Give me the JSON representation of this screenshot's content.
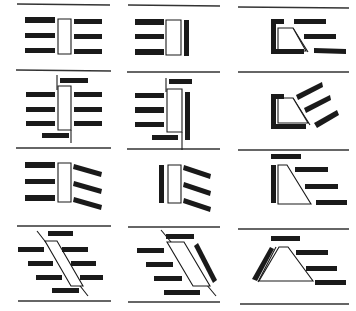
{
  "diagram": {
    "grid": {
      "rows": 4,
      "cols": 3
    },
    "colors": {
      "ink": "#1a1a1a",
      "paper": "#ffffff",
      "line": "#333333"
    },
    "separators": [
      {
        "x1": 17,
        "y1": 4,
        "x2": 110,
        "y2": 5
      },
      {
        "x1": 128,
        "y1": 5,
        "x2": 220,
        "y2": 6
      },
      {
        "x1": 238,
        "y1": 7,
        "x2": 349,
        "y2": 8
      },
      {
        "x1": 16,
        "y1": 70,
        "x2": 111,
        "y2": 71
      },
      {
        "x1": 127,
        "y1": 72,
        "x2": 220,
        "y2": 72
      },
      {
        "x1": 238,
        "y1": 72,
        "x2": 349,
        "y2": 72
      },
      {
        "x1": 16,
        "y1": 148,
        "x2": 111,
        "y2": 148
      },
      {
        "x1": 127,
        "y1": 149,
        "x2": 220,
        "y2": 149
      },
      {
        "x1": 238,
        "y1": 150,
        "x2": 349,
        "y2": 150
      },
      {
        "x1": 17,
        "y1": 226,
        "x2": 111,
        "y2": 226
      },
      {
        "x1": 128,
        "y1": 227,
        "x2": 220,
        "y2": 227
      },
      {
        "x1": 238,
        "y1": 229,
        "x2": 349,
        "y2": 229
      },
      {
        "x1": 18,
        "y1": 301,
        "x2": 111,
        "y2": 301
      },
      {
        "x1": 128,
        "y1": 302,
        "x2": 220,
        "y2": 302
      },
      {
        "x1": 240,
        "y1": 304,
        "x2": 349,
        "y2": 304
      }
    ],
    "panels": [
      {
        "id": "r1c1",
        "label": "Centre pier, perpendicular berths both sides",
        "outlines": [
          {
            "points": "58,19 71,19 71,54 58,54"
          }
        ],
        "bars": [
          "25,17 55,17 55,23 25,23",
          "25,33 55,33 55,38 25,38",
          "25,48 55,48 55,53 25,53",
          "74,19 102,19 102,24 74,24",
          "74,34 102,34 102,39 74,39",
          "74,49 102,49 102,54 74,54"
        ],
        "lines": []
      },
      {
        "id": "r1c2",
        "label": "Quay pier, perpendicular berths one side, wall backing",
        "outlines": [
          {
            "points": "166,20 181,20 181,55 166,55"
          }
        ],
        "bars": [
          "135,19 164,19 164,25 135,25",
          "135,34 164,34 164,39 135,39",
          "135,49 164,49 164,55 135,55",
          "184,20 189,20 189,56 184,56"
        ],
        "lines": []
      },
      {
        "id": "r1c3",
        "label": "Corner basin, trapezoid slip, parallel berths",
        "outlines": [
          {
            "points": "278,28 293,28 306,51 278,51"
          }
        ],
        "bars": [
          "271,19 276,19 276,54 271,54",
          "271,19 284,19 284,24 271,24",
          "271,49 304,49 304,54 271,54",
          "294,19 326,19 326,24 294,24",
          "304,34 336,34 336,39 304,39",
          "314,48 346,49 346,54 314,53"
        ],
        "lines": [
          {
            "x1": 293,
            "y1": 28,
            "x2": 308,
            "y2": 52
          }
        ]
      },
      {
        "id": "r2c1",
        "label": "Centre pier, staggered end berths",
        "outlines": [
          {
            "points": "58,86 71,86 71,130 58,130"
          }
        ],
        "bars": [
          "60,78 88,78 88,83 60,83",
          "26,92 55,92 55,97 26,97",
          "26,107 55,107 55,112 26,112",
          "26,121 55,121 55,126 26,126",
          "74,92 102,92 102,97 74,97",
          "74,107 102,107 102,112 74,112",
          "74,121 102,121 102,126 74,126",
          "42,133 69,133 69,138 42,138"
        ],
        "lines": [
          {
            "x1": 57,
            "y1": 75,
            "x2": 57,
            "y2": 90
          },
          {
            "x1": 71,
            "y1": 130,
            "x2": 71,
            "y2": 143
          }
        ]
      },
      {
        "id": "r2c2",
        "label": "Quay pier with staggered end berths and wall",
        "outlines": [
          {
            "points": "167,89 182,89 182,132 167,132"
          }
        ],
        "bars": [
          "169,79 192,79 192,84 169,84",
          "135,93 164,93 164,98 135,98",
          "135,107 164,107 164,113 135,113",
          "135,122 164,122 164,127 135,127",
          "185,92 190,92 190,140 185,140",
          "152,135 178,135 178,140 152,140"
        ],
        "lines": [
          {
            "x1": 166,
            "y1": 78,
            "x2": 166,
            "y2": 92
          },
          {
            "x1": 182,
            "y1": 132,
            "x2": 182,
            "y2": 146
          }
        ]
      },
      {
        "id": "r2c3",
        "label": "Corner basin, angled (herringbone) berths",
        "outlines": [
          {
            "points": "278,98 293,98 308,123 278,123"
          }
        ],
        "bars": [
          "271,94 276,94 276,128 271,128",
          "271,94 284,94 284,99 271,99",
          "271,124 306,124 306,129 271,129",
          "296,95 322,82 323,87 298,100",
          "304,108 330,95 331,100 306,113",
          "314,123 337,110 339,115 317,128"
        ],
        "lines": [
          {
            "x1": 293,
            "y1": 98,
            "x2": 310,
            "y2": 125
          }
        ]
      },
      {
        "id": "r3c1",
        "label": "Centre pier, perpendicular one side, angled other side",
        "outlines": [
          {
            "points": "58,163 71,163 71,202 58,202"
          }
        ],
        "bars": [
          "25,162 55,162 55,168 25,168",
          "25,179 55,179 55,184 25,184",
          "25,195 55,195 55,201 25,201",
          "74,164 102,172 101,177 73,169",
          "74,181 102,189 101,194 73,186",
          "74,197 102,205 101,210 73,202"
        ],
        "lines": []
      },
      {
        "id": "r3c2",
        "label": "Wall-backed pier, angled berths one side",
        "outlines": [
          {
            "points": "168,165 181,165 181,203 168,203"
          }
        ],
        "bars": [
          "159,165 164,165 164,203 159,203",
          "184,165 211,174 210,179 183,170",
          "184,182 211,191 210,196 183,187",
          "184,198 211,207 210,212 183,203"
        ],
        "lines": [
          {
            "x1": 182,
            "y1": 146,
            "x2": 182,
            "y2": 150
          }
        ]
      },
      {
        "id": "r3c3",
        "label": "Trapezoid basin, stepped parallel berths",
        "outlines": [
          {
            "points": "278,165 287,165 311,204 278,204"
          }
        ],
        "bars": [
          "271,154 301,154 301,159 271,159",
          "271,165 276,165 276,203 271,203",
          "295,167 328,167 328,172 295,172",
          "305,184 338,184 338,189 305,189",
          "316,200 347,200 347,205 316,205"
        ],
        "lines": []
      },
      {
        "id": "r4c1",
        "label": "Diagonal pier, offset berths both sides",
        "outlines": [
          {
            "points": "45,241 57,241 83,286 71,286"
          }
        ],
        "bars": [
          "48,231 73,231 73,236 48,236",
          "18,247 44,247 44,252 18,252",
          "28,261 53,261 53,266 28,266",
          "36,275 62,275 62,280 36,280",
          "62,247 88,247 88,252 62,252",
          "71,261 96,261 96,266 71,266",
          "80,275 103,275 103,280 80,280",
          "52,288 79,288 79,293 52,293"
        ],
        "lines": [
          {
            "x1": 37,
            "y1": 231,
            "x2": 88,
            "y2": 296
          }
        ]
      },
      {
        "id": "r4c2",
        "label": "Diagonal pier with angled wall, offset berths one side",
        "outlines": [
          {
            "points": "167,242 184,242 210,286 193,286"
          }
        ],
        "bars": [
          "166,234 194,234 194,239 166,239",
          "137,248 164,248 164,253 137,253",
          "146,262 173,262 173,267 146,267",
          "154,276 182,276 182,281 154,281",
          "164,290 200,290 200,295 164,295",
          "194,246 198,243 217,280 213,283"
        ],
        "lines": [
          {
            "x1": 161,
            "y1": 230,
            "x2": 216,
            "y2": 296
          }
        ]
      },
      {
        "id": "r4c3",
        "label": "Trapezoid basin with sloped wall, stepped berths",
        "outlines": [
          {
            "points": "279,247 288,247 313,281 259,281"
          }
        ],
        "bars": [
          "271,236 300,236 300,241 271,241",
          "270,247 274,249 257,281 252,279",
          "296,250 328,250 328,255 296,255",
          "306,266 337,266 337,271 306,271",
          "315,280 346,280 346,285 315,285"
        ],
        "lines": [
          {
            "x1": 258,
            "y1": 282,
            "x2": 276,
            "y2": 247
          }
        ]
      }
    ]
  }
}
